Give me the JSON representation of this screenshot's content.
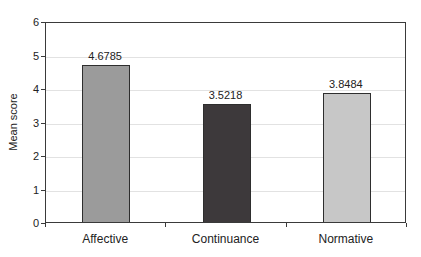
{
  "chart_data": {
    "type": "bar",
    "categories": [
      "Affective",
      "Continuance",
      "Normative"
    ],
    "values": [
      4.6785,
      3.5218,
      3.8484
    ],
    "value_labels": [
      "4.6785",
      "3.5218",
      "3.8484"
    ],
    "title": "",
    "xlabel": "",
    "ylabel": "Mean score",
    "ylim": [
      0,
      6
    ],
    "ytick_step": 1,
    "yticks": [
      "0",
      "1",
      "2",
      "3",
      "4",
      "5",
      "6"
    ],
    "grid": true,
    "legend_position": "none",
    "bar_colors": [
      "#9b9b9b",
      "#3d393b",
      "#c7c7c7"
    ],
    "bar_outline_color": "#2e2e2e",
    "axis_color": "#3a3a3a",
    "gridline_color": "#e2e2e2",
    "background_color": "#ffffff"
  }
}
